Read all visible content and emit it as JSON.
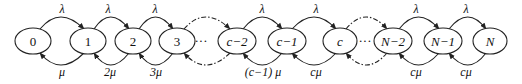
{
  "diagram": {
    "type": "birth-death-markov-chain",
    "nodes": [
      {
        "id": "n0",
        "label": "0",
        "cx": 33
      },
      {
        "id": "n1",
        "label": "1",
        "cx": 88
      },
      {
        "id": "n2",
        "label": "2",
        "cx": 133
      },
      {
        "id": "n3",
        "label": "3",
        "cx": 177
      },
      {
        "id": "nc2",
        "label": "c−2",
        "cx": 237
      },
      {
        "id": "nc1",
        "label": "c−1",
        "cx": 286
      },
      {
        "id": "nc",
        "label": "c",
        "cx": 340
      },
      {
        "id": "nN2",
        "label": "N−2",
        "cx": 393
      },
      {
        "id": "nN1",
        "label": "N−1",
        "cx": 443
      },
      {
        "id": "nN",
        "label": "N",
        "cx": 490
      }
    ],
    "ellipsis": "···",
    "arrival_rate": "λ",
    "forward_labels": [
      "λ",
      "λ",
      "λ",
      "λ",
      "λ",
      "λ",
      "λ"
    ],
    "backward_labels": [
      "μ",
      "2μ",
      "3μ",
      "(c−1) μ",
      "cμ",
      "cμ",
      "cμ"
    ]
  }
}
